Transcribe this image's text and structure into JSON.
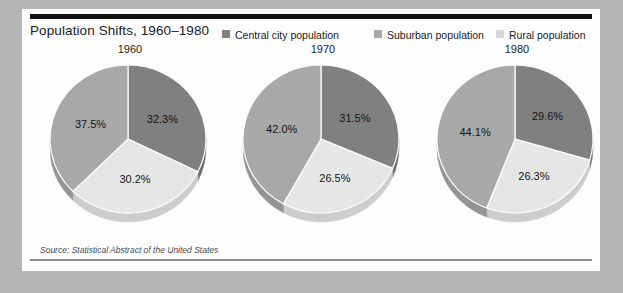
{
  "page": {
    "background_color": "#b4b4b4",
    "card_background": "#fdfdfd"
  },
  "header": {
    "title": "Population Shifts, 1960–1980",
    "rule_color": "#111111"
  },
  "legend": {
    "position": "top-right",
    "items": [
      {
        "label": "Central city population",
        "color": "#808080"
      },
      {
        "label": "Suburban population",
        "color": "#a8a8a8"
      },
      {
        "label": "Rural population",
        "color": "#d8d8d8"
      }
    ]
  },
  "source": {
    "text": "Source: Statistical Abstract of the United States"
  },
  "chart_data": {
    "type": "pie",
    "title": "Population Shifts, 1960–1980",
    "subtitle": "",
    "xlabel": "",
    "ylabel": "",
    "units": "percent",
    "legend_position": "top-right",
    "grid": false,
    "series_names": [
      "Central city population",
      "Suburban population",
      "Rural population"
    ],
    "colors": {
      "central_city": "#808080",
      "suburban": "#a8a8a8",
      "rural": "#e6e6e6"
    },
    "panels": [
      {
        "year": "1960",
        "labels": [
          "Central city population",
          "Rural population",
          "Suburban population"
        ],
        "values": [
          32.3,
          30.2,
          37.5
        ],
        "value_labels": [
          "32.3%",
          "30.2%",
          "37.5%"
        ]
      },
      {
        "year": "1970",
        "labels": [
          "Central city population",
          "Rural population",
          "Suburban population"
        ],
        "values": [
          31.5,
          26.5,
          42.0
        ],
        "value_labels": [
          "31.5%",
          "26.5%",
          "42.0%"
        ]
      },
      {
        "year": "1980",
        "labels": [
          "Central city population",
          "Rural population",
          "Suburban population"
        ],
        "values": [
          29.6,
          26.3,
          44.1
        ],
        "value_labels": [
          "29.6%",
          "26.3%",
          "44.1%"
        ]
      }
    ]
  }
}
